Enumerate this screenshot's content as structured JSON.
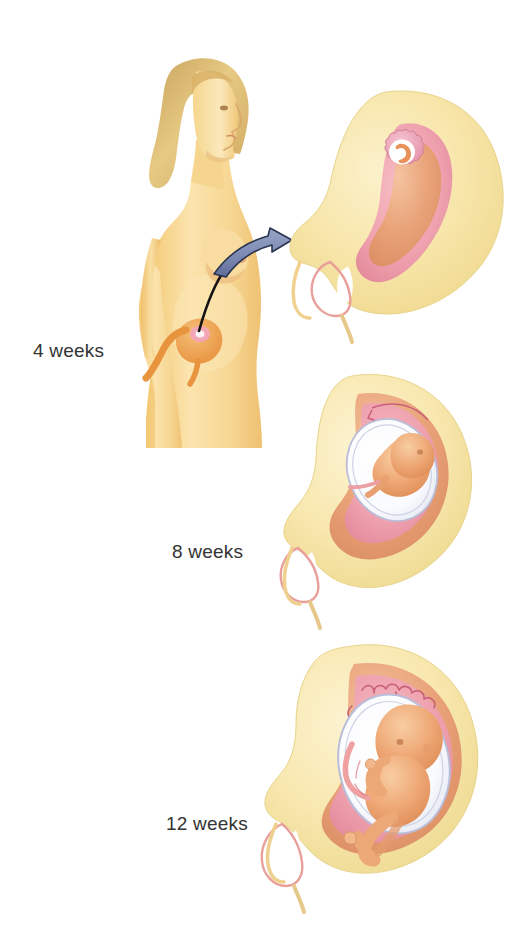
{
  "illustration": {
    "title": "Stages of Pregnancy",
    "subject": "Development of the embryo and fetus in the uterus at four, eight and twelve weeks",
    "background_color": "#ffffff",
    "label_color": "#333333"
  },
  "labels": {
    "week4": "4 weeks",
    "week8": "8 weeks",
    "week12": "12 weeks"
  },
  "figure": {
    "woman": {
      "name": "woman-profile",
      "description": "Side profile of a nude standing woman facing right, shown from head to mid-thigh",
      "skin_color": "#F5CE7E",
      "skin_highlight": "#FDEBC0",
      "hair_color": "#D9B368",
      "inset_uterus_color": "#EFA24E",
      "inset_embryo_color": "#E88FA0"
    },
    "pointer": {
      "name": "callout-arrow",
      "description": "Curved arrow from the woman's pelvis to the 4-week uterus diagram",
      "leader_color": "#1A1A1A",
      "arrow_fill": "#7E8CB5",
      "arrow_stroke": "#2C3550"
    }
  },
  "stages": [
    {
      "id": "week4",
      "label": "4 weeks",
      "name": "uterus-4-weeks",
      "description": "Pear-shaped uterus tilted to the right with a small embryo implanted in the upper-left wall",
      "uterus_wall": "#F7E5A8",
      "endometrium": "#F0A5A8",
      "cavity": "#E9A278",
      "embryo_sac": "#EFA9BC",
      "amniotic_fluid": "#FFFFFF",
      "embryo": "#E8915B",
      "cervix_canal": "#FFFFFF"
    },
    {
      "id": "week8",
      "label": "8 weeks",
      "name": "uterus-8-weeks",
      "description": "Enlarged uterus containing a curled fetus within a white amniotic sac surrounded by pink decidua",
      "uterus_wall": "#F7E5A8",
      "endometrium": "#EE9DAE",
      "cavity": "#E9A278",
      "amniotic_sac": "#FBFCFE",
      "amnion_outline": "#B9BDD8",
      "fetus": "#EDA170",
      "villi_outline": "#C9607A",
      "cervix_canal": "#FFFFFF"
    },
    {
      "id": "week12",
      "label": "12 weeks",
      "name": "uterus-12-weeks",
      "description": "Large rounded uterus with a well-formed fetus, visible head, arms, legs and umbilical cord inside a white amniotic sac",
      "uterus_wall": "#F7E5A8",
      "endometrium": "#F0A0B0",
      "cavity": "#E9A278",
      "amniotic_sac": "#FCFDFF",
      "amnion_outline": "#B9BDD8",
      "fetus": "#EFA878",
      "cord": "#EFA0A0",
      "villi_outline": "#C9607A",
      "cervix_canal": "#FFFFFF"
    }
  ]
}
